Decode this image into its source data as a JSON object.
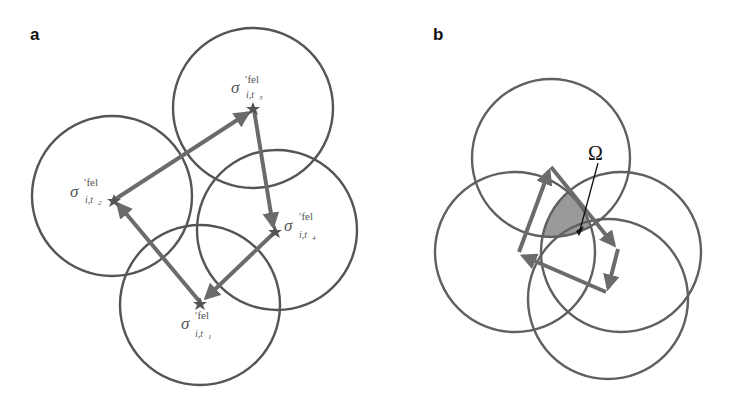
{
  "figure": {
    "panels": [
      {
        "id": "a",
        "label": "a",
        "circles": [
          {
            "name": "t1",
            "cx": 200,
            "cy": 305,
            "r": 80
          },
          {
            "name": "t2",
            "cx": 112,
            "cy": 196,
            "r": 80
          },
          {
            "name": "t3",
            "cx": 253,
            "cy": 108,
            "r": 80
          },
          {
            "name": "t4",
            "cx": 277,
            "cy": 230,
            "r": 80
          }
        ],
        "points": [
          {
            "name": "t1",
            "x": 200,
            "y": 302,
            "symbol": "σ",
            "sup": "′fel",
            "sub": "i,t",
            "subsub": "1"
          },
          {
            "name": "t2",
            "x": 114,
            "y": 200,
            "symbol": "σ",
            "sup": "′fel",
            "sub": "i,t",
            "subsub": "2"
          },
          {
            "name": "t3",
            "x": 253,
            "y": 110,
            "symbol": "σ",
            "sup": "′fel",
            "sub": "i,t",
            "subsub": "3"
          },
          {
            "name": "t4",
            "x": 275,
            "y": 230,
            "symbol": "σ",
            "sup": "′fel",
            "sub": "i,t",
            "subsub": "4"
          }
        ],
        "arrows": [
          {
            "from": "t1",
            "to": "t2"
          },
          {
            "from": "t2",
            "to": "t3"
          },
          {
            "from": "t3",
            "to": "t4"
          },
          {
            "from": "t4",
            "to": "t1"
          }
        ]
      },
      {
        "id": "b",
        "label": "b",
        "circles": [
          {
            "name": "top",
            "cx": 551,
            "cy": 158,
            "r": 79
          },
          {
            "name": "left",
            "cx": 515,
            "cy": 252,
            "r": 80
          },
          {
            "name": "right",
            "cx": 621,
            "cy": 252,
            "r": 80
          },
          {
            "name": "bottom",
            "cx": 608,
            "cy": 299,
            "r": 80
          }
        ],
        "annotation": {
          "symbol": "Ω",
          "meaning": "intersection region"
        }
      }
    ],
    "colors": {
      "circle": "#555555",
      "arrow": "#6b6b6b",
      "shaded_region": "#9a9a9a",
      "text": "#555555",
      "label": "#111111"
    }
  }
}
